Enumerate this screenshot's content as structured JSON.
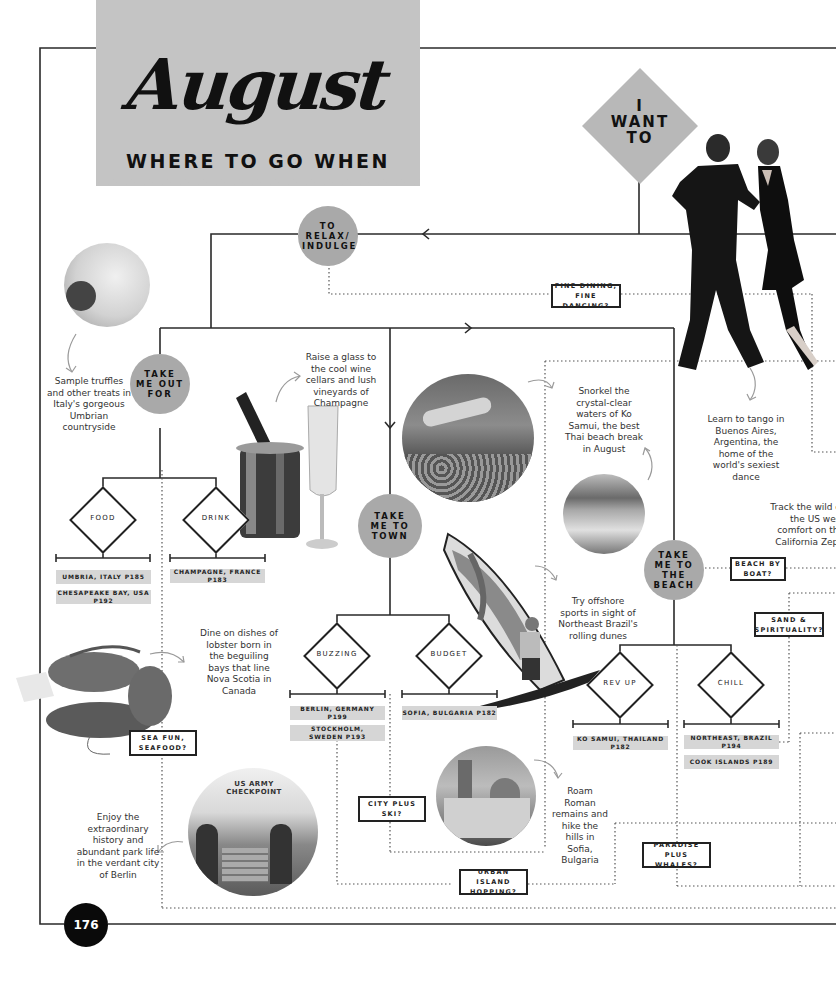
{
  "header": {
    "title": "August",
    "subtitle": "WHERE TO GO WHEN"
  },
  "start": {
    "label_lines": [
      "I",
      "WANT",
      "TO"
    ]
  },
  "categories": {
    "relax": "TO RELAX/ INDULGE",
    "out_for": "TAKE ME OUT FOR",
    "town": "TAKE ME TO TOWN",
    "beach": "TAKE ME TO THE BEACH"
  },
  "decisions": {
    "food": "FOOD",
    "drink": "DRINK",
    "buzzing": "BUZZING",
    "budget": "BUDGET",
    "rev_up": "REV UP",
    "chill": "CHILL"
  },
  "destinations": {
    "umbria": "UMBRIA, ITALY P185",
    "chesapeake": "CHESAPEAKE BAY, USA P192",
    "champagne": "CHAMPAGNE, FRANCE P183",
    "berlin": "BERLIN, GERMANY P199",
    "stockholm": "STOCKHOLM, SWEDEN P193",
    "sofia": "SOFIA, BULGARIA P182",
    "ko_samui": "KO SAMUI, THAILAND P182",
    "northeast_brazil": "NORTHEAST, BRAZIL P194",
    "cook_islands": "COOK ISLANDS P189"
  },
  "questions": {
    "fine_dining": "FINE DINING, FINE DANCING?",
    "sea_fun": "SEA FUN, SEAFOOD?",
    "city_ski": "CITY PLUS SKI?",
    "urban_island": "URBAN ISLAND HOPPING?",
    "paradise_whales": "PARADISE PLUS WHALES?",
    "beach_boat": "BEACH BY BOAT?",
    "sand_spirit": "SAND & SPIRITUALITY?"
  },
  "captions": {
    "truffles": "Sample truffles and other treats in Italy's gorgeous Umbrian countryside",
    "champagne": "Raise a glass to the cool wine cellars and lush vineyards of Champagne",
    "snorkel": "Snorkel the crystal-clear waters of Ko Samui, the best Thai beach break in August",
    "tango": "Learn to tango in Buenos Aires, Argentina, the home of the world's sexiest dance",
    "zephyr": "Track the wild of the US west comfort on the California Zeph",
    "offshore": "Try offshore sports in sight of Northeast Brazil's rolling dunes",
    "lobster": "Dine on dishes of lobster born in the beguiling bays that line Nova Scotia in Canada",
    "sofia": "Roam Roman remains and hike the hills in Sofia, Bulgaria",
    "berlin": "Enjoy the extraordinary history and abundant park life in the verdant city of Berlin"
  },
  "images": {
    "pasta": "pasta-truffle-photo",
    "champagne": "champagne-bucket-photo",
    "snorkel": "snorkel-reef-photo",
    "beach": "tropical-beach-photo",
    "tango": "tango-dancers-photo",
    "windsurf": "windsurfer-photo",
    "lobster": "lobster-photo",
    "checkpoint": "checkpoint-charlie-photo",
    "cathedral": "sofia-cathedral-photo"
  },
  "page_number": "176",
  "colors": {
    "banner": "#c4c4c4",
    "category_circle": "#a9a9a9",
    "tag": "#d6d6d6",
    "line": "#222222",
    "page_badge": "#0a0a0a"
  }
}
